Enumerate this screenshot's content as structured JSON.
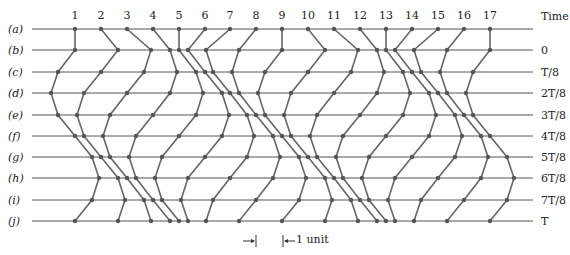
{
  "particles": [
    "1",
    "2",
    "3",
    "4",
    "5",
    "6",
    "7",
    "8",
    "9",
    "10",
    "11",
    "12",
    "13",
    "14",
    "15",
    "16",
    "17"
  ],
  "particle_x": [
    75,
    101,
    127,
    153,
    179,
    205,
    230,
    256,
    282,
    308,
    334,
    360,
    386,
    412,
    438,
    464,
    490
  ],
  "time_header": "Time",
  "rows": [
    {
      "label": "(a)",
      "time": "",
      "y": 29,
      "x": [
        75,
        101,
        127,
        153,
        179,
        205,
        230,
        256,
        282,
        308,
        334,
        360,
        386,
        412,
        438,
        464,
        490
      ]
    },
    {
      "label": "(b)",
      "time": "0",
      "y": 50,
      "x": [
        75,
        118,
        151,
        170,
        179,
        188,
        206,
        239,
        282,
        325,
        358,
        377,
        386,
        395,
        414,
        447,
        490
      ]
    },
    {
      "label": "(c)",
      "time": "T/8",
      "y": 72,
      "x": [
        58,
        101,
        144,
        177,
        196,
        205,
        213,
        232,
        265,
        308,
        351,
        384,
        403,
        412,
        421,
        440,
        473
      ]
    },
    {
      "label": "(d)",
      "time": "2T/8",
      "y": 93,
      "x": [
        51,
        84,
        127,
        170,
        203,
        222,
        230,
        239,
        258,
        291,
        334,
        377,
        410,
        429,
        438,
        447,
        466
      ]
    },
    {
      "label": "(e)",
      "time": "3T/8",
      "y": 115,
      "x": [
        58,
        77,
        110,
        153,
        196,
        229,
        247,
        256,
        265,
        284,
        317,
        360,
        403,
        436,
        455,
        464,
        473
      ]
    },
    {
      "label": "(f)",
      "time": "4T/8",
      "y": 136,
      "x": [
        75,
        84,
        103,
        136,
        179,
        222,
        254,
        273,
        282,
        291,
        310,
        343,
        386,
        429,
        462,
        481,
        490
      ]
    },
    {
      "label": "(g)",
      "time": "5T/8",
      "y": 157,
      "x": [
        92,
        101,
        110,
        129,
        162,
        205,
        247,
        280,
        299,
        308,
        317,
        336,
        369,
        412,
        455,
        488,
        507
      ]
    },
    {
      "label": "(h)",
      "time": "6T/8",
      "y": 178,
      "x": [
        99,
        118,
        127,
        136,
        155,
        188,
        230,
        273,
        306,
        325,
        334,
        343,
        362,
        395,
        438,
        481,
        514
      ]
    },
    {
      "label": "(i)",
      "time": "7T/8",
      "y": 200,
      "x": [
        92,
        125,
        144,
        153,
        162,
        181,
        213,
        256,
        299,
        332,
        351,
        360,
        369,
        388,
        421,
        464,
        507
      ]
    },
    {
      "label": "(j)",
      "time": "T",
      "y": 221,
      "x": [
        75,
        118,
        151,
        170,
        179,
        188,
        206,
        239,
        282,
        325,
        358,
        377,
        386,
        395,
        414,
        447,
        490
      ]
    }
  ],
  "line_start_x": 32,
  "line_end_x": 533,
  "scale_bar": {
    "tick1_x": 256,
    "tick2_x": 283,
    "y": 241,
    "label": "1 unit"
  },
  "colors": {
    "line": "#555555",
    "track": "#666666",
    "dot": "#555555"
  }
}
